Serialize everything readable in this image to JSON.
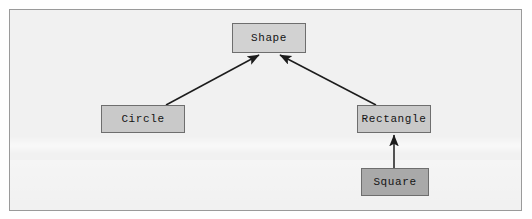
{
  "diagram": {
    "type": "class-inheritance",
    "canvas": {
      "width": 532,
      "height": 219,
      "background_color": "#f1f1f1",
      "border_color": "#9a9a9a",
      "page_background_color": "#ffffff"
    },
    "nodes": [
      {
        "id": "shape",
        "label": "Shape",
        "x": 232,
        "y": 23,
        "width": 74,
        "height": 30,
        "fill_color": "#d2d2d2",
        "border_color": "#6e6e6e",
        "text_color": "#141414"
      },
      {
        "id": "circle",
        "label": "Circle",
        "x": 101,
        "y": 105,
        "width": 84,
        "height": 28,
        "fill_color": "#c9c9c9",
        "border_color": "#6e6e6e",
        "text_color": "#141414"
      },
      {
        "id": "rectangle",
        "label": "Rectangle",
        "x": 357,
        "y": 105,
        "width": 74,
        "height": 28,
        "fill_color": "#c9c9c9",
        "border_color": "#6e6e6e",
        "text_color": "#141414"
      },
      {
        "id": "square",
        "label": "Square",
        "x": 361,
        "y": 168,
        "width": 68,
        "height": 28,
        "fill_color": "#a9a9a9",
        "border_color": "#6e6e6e",
        "text_color": "#141414"
      }
    ],
    "edges": [
      {
        "id": "circle-to-shape",
        "from": "circle",
        "to": "shape",
        "relation": "inherits",
        "arrow_at": "to",
        "color": "#1c1c1c",
        "x1": 166,
        "y1": 105,
        "x2": 259,
        "y2": 55
      },
      {
        "id": "rectangle-to-shape",
        "from": "rectangle",
        "to": "shape",
        "relation": "inherits",
        "arrow_at": "to",
        "color": "#1c1c1c",
        "x1": 376,
        "y1": 105,
        "x2": 280,
        "y2": 55
      },
      {
        "id": "square-to-rectangle",
        "from": "square",
        "to": "rectangle",
        "relation": "inherits",
        "arrow_at": "to",
        "color": "#1c1c1c",
        "x1": 394,
        "y1": 168,
        "x2": 394,
        "y2": 135
      }
    ]
  }
}
